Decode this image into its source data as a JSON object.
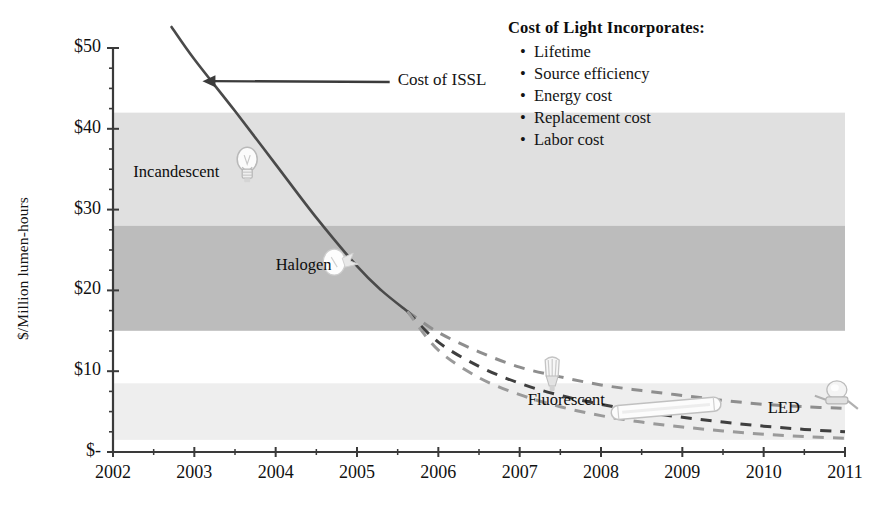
{
  "chart_data": {
    "type": "line",
    "title": "",
    "xlabel": "",
    "ylabel": "$/Million lumen-hours",
    "xlim": [
      2002,
      2011
    ],
    "ylim": [
      0,
      50
    ],
    "grid": false,
    "x_ticks": [
      "2002",
      "2003",
      "2004",
      "2005",
      "2006",
      "2007",
      "2008",
      "2009",
      "2010",
      "2011"
    ],
    "y_ticks": [
      "$-",
      "$10",
      "$20",
      "$30",
      "$40",
      "$50"
    ],
    "y_tick_values": [
      0,
      10,
      20,
      30,
      40,
      50
    ],
    "y_minor_tick_values": [
      2.5,
      5,
      7.5,
      12.5,
      15,
      17.5,
      22.5,
      25,
      27.5,
      32.5,
      35,
      37.5,
      42.5,
      45,
      47.5
    ],
    "series": [
      {
        "name": "Cost of ISSL",
        "style": "solid",
        "color": "#4a4a4a",
        "points": [
          [
            2002.72,
            52.6
          ],
          [
            2003.0,
            48.6
          ],
          [
            2003.5,
            42.2
          ],
          [
            2004.0,
            35.6
          ],
          [
            2004.5,
            29.0
          ],
          [
            2005.0,
            23.0
          ],
          [
            2005.3,
            20.0
          ],
          [
            2005.62,
            17.4
          ]
        ]
      },
      {
        "name": "ISSL projection high",
        "style": "dashed",
        "color": "#8e8e8e",
        "points": [
          [
            2005.62,
            17.4
          ],
          [
            2006.0,
            14.8
          ],
          [
            2006.5,
            12.4
          ],
          [
            2007.0,
            10.5
          ],
          [
            2007.5,
            9.3
          ],
          [
            2008.0,
            8.3
          ],
          [
            2008.5,
            7.6
          ],
          [
            2009.0,
            7.0
          ],
          [
            2009.5,
            6.4
          ],
          [
            2010.0,
            5.9
          ],
          [
            2010.5,
            5.6
          ],
          [
            2011.0,
            5.4
          ]
        ]
      },
      {
        "name": "ISSL projection mid",
        "style": "dashed",
        "color": "#3f3f3f",
        "points": [
          [
            2005.62,
            17.4
          ],
          [
            2006.0,
            13.6
          ],
          [
            2006.5,
            10.6
          ],
          [
            2007.0,
            8.5
          ],
          [
            2007.5,
            7.0
          ],
          [
            2008.0,
            5.9
          ],
          [
            2008.5,
            5.0
          ],
          [
            2009.0,
            4.3
          ],
          [
            2009.5,
            3.7
          ],
          [
            2010.0,
            3.2
          ],
          [
            2010.5,
            2.8
          ],
          [
            2011.0,
            2.5
          ]
        ]
      },
      {
        "name": "ISSL projection low",
        "style": "dashed",
        "color": "#9a9a9a",
        "points": [
          [
            2005.62,
            17.4
          ],
          [
            2006.0,
            12.6
          ],
          [
            2006.5,
            9.2
          ],
          [
            2007.0,
            7.1
          ],
          [
            2007.5,
            5.6
          ],
          [
            2008.0,
            4.5
          ],
          [
            2008.5,
            3.7
          ],
          [
            2009.0,
            3.1
          ],
          [
            2009.5,
            2.6
          ],
          [
            2010.0,
            2.2
          ],
          [
            2010.5,
            1.9
          ],
          [
            2011.0,
            1.7
          ]
        ]
      }
    ],
    "bands": [
      {
        "name": "Incandescent",
        "label": "Incandescent",
        "y_low": 28.0,
        "y_high": 42.0,
        "color": "#e0e0e0",
        "label_x": 2002.25,
        "label_y": 34.5
      },
      {
        "name": "Halogen",
        "label": "Halogen",
        "y_low": 15.0,
        "y_high": 28.0,
        "color": "#bcbcbc",
        "label_x": 2004.0,
        "label_y": 23.0
      },
      {
        "name": "Fluorescent",
        "label": "Fluorescent",
        "y_low": 1.5,
        "y_high": 8.5,
        "color": "#eeeeee",
        "label_x": 2007.1,
        "label_y": 6.3
      }
    ],
    "annotations": [
      {
        "name": "cost-of-issl",
        "text": "Cost of ISSL",
        "x": 2005.5,
        "y": 45.8,
        "arrow_to_x": 2003.1,
        "arrow_to_y": 45.9
      }
    ],
    "icons": [
      {
        "name": "incandescent-bulb-icon",
        "x": 2003.65,
        "y": 35.5
      },
      {
        "name": "halogen-capsule-icon",
        "x": 2004.72,
        "y": 23.5
      },
      {
        "name": "cfl-bulb-icon",
        "x": 2007.4,
        "y": 9.4
      },
      {
        "name": "fluorescent-tube-icon",
        "x": 2008.8,
        "y": 5.4
      },
      {
        "name": "led-emitter-icon",
        "x": 2010.9,
        "y": 7.2
      }
    ],
    "led_label": {
      "text": "LED",
      "x": 2010.05,
      "y": 5.3
    }
  },
  "legend": {
    "title": "Cost of Light Incorporates:",
    "bullet_char": "•",
    "items": [
      "Lifetime",
      "Source efficiency",
      "Energy cost",
      "Replacement cost",
      "Labor cost"
    ]
  },
  "colors": {
    "axis": "#3a3a3a",
    "text": "#141414",
    "band_incandescent": "#e0e0e0",
    "band_halogen": "#bcbcbc",
    "band_fluorescent": "#eeeeee",
    "curve_solid": "#4a4a4a"
  }
}
